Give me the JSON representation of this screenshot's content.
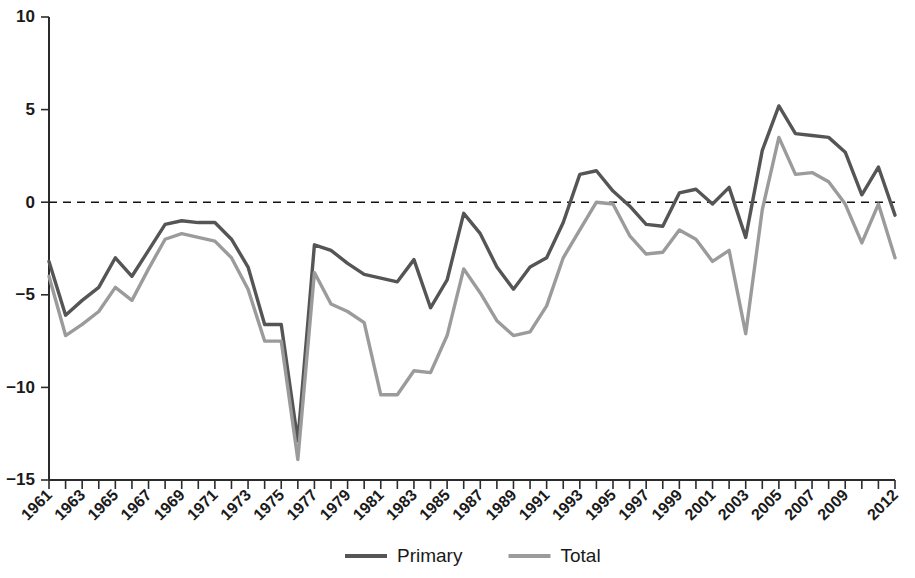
{
  "chart_data": {
    "type": "line",
    "title": "",
    "subtitle": "",
    "xlabel": "",
    "ylabel": "",
    "grid": false,
    "legend_position": "bottom-center",
    "ylim": [
      -15,
      10
    ],
    "yticks": [
      10,
      5,
      0,
      -5,
      -10,
      -15
    ],
    "ytick_labels": [
      "10",
      "5",
      "0",
      "−5",
      "−10",
      "−15"
    ],
    "xlim": [
      1961,
      2012
    ],
    "x": [
      1961,
      1962,
      1963,
      1964,
      1965,
      1966,
      1967,
      1968,
      1969,
      1970,
      1971,
      1972,
      1973,
      1974,
      1975,
      1976,
      1977,
      1978,
      1979,
      1980,
      1981,
      1982,
      1983,
      1984,
      1985,
      1986,
      1987,
      1988,
      1989,
      1990,
      1991,
      1992,
      1993,
      1994,
      1995,
      1996,
      1997,
      1998,
      1999,
      2000,
      2001,
      2002,
      2003,
      2004,
      2005,
      2006,
      2007,
      2008,
      2009,
      2010,
      2011,
      2012
    ],
    "xtick_labels": [
      "1961",
      "1963",
      "1965",
      "1967",
      "1969",
      "1971",
      "1973",
      "1975",
      "1977",
      "1979",
      "1981",
      "1983",
      "1985",
      "1987",
      "1989",
      "1991",
      "1993",
      "1995",
      "1997",
      "1999",
      "2001",
      "2003",
      "2005",
      "2007",
      "2009",
      "2012"
    ],
    "xtick_years": [
      1961,
      1963,
      1965,
      1967,
      1969,
      1971,
      1973,
      1975,
      1977,
      1979,
      1981,
      1983,
      1985,
      1987,
      1989,
      1991,
      1993,
      1995,
      1997,
      1999,
      2001,
      2003,
      2005,
      2007,
      2009,
      2012
    ],
    "zero_reference_line": 0,
    "series": [
      {
        "name": "Primary",
        "color": "#555555",
        "values": [
          -3.2,
          -6.1,
          -5.3,
          -4.6,
          -3.0,
          -4.0,
          -2.6,
          -1.2,
          -1.0,
          -1.1,
          -1.1,
          -2.0,
          -3.5,
          -6.6,
          -6.6,
          -12.9,
          -2.3,
          -2.6,
          -3.3,
          -3.9,
          -4.1,
          -4.3,
          -3.1,
          -5.7,
          -4.2,
          -0.6,
          -1.7,
          -3.5,
          -4.7,
          -3.5,
          -3.0,
          -1.1,
          1.5,
          1.7,
          0.6,
          -0.2,
          -1.2,
          -1.3,
          0.5,
          0.7,
          -0.1,
          0.8,
          -1.9,
          2.8,
          5.2,
          3.7,
          3.6,
          3.5,
          2.7,
          0.4,
          1.9,
          -0.7
        ]
      },
      {
        "name": "Total",
        "color": "#9b9b9b",
        "values": [
          -4.0,
          -7.2,
          -6.6,
          -5.9,
          -4.6,
          -5.3,
          -3.6,
          -2.0,
          -1.7,
          -1.9,
          -2.1,
          -3.0,
          -4.7,
          -7.5,
          -7.5,
          -13.9,
          -3.8,
          -5.5,
          -5.9,
          -6.5,
          -10.4,
          -10.4,
          -9.1,
          -9.2,
          -7.2,
          -3.6,
          -4.9,
          -6.4,
          -7.2,
          -7.0,
          -5.6,
          -3.0,
          -1.5,
          0.0,
          -0.1,
          -1.8,
          -2.8,
          -2.7,
          -1.5,
          -2.0,
          -3.2,
          -2.6,
          -7.1,
          -0.4,
          3.5,
          1.5,
          1.6,
          1.1,
          -0.1,
          -2.2,
          -0.1,
          -3.0
        ]
      }
    ]
  },
  "legend": {
    "items": [
      {
        "label": "Primary",
        "color": "#555555"
      },
      {
        "label": "Total",
        "color": "#9b9b9b"
      }
    ]
  }
}
